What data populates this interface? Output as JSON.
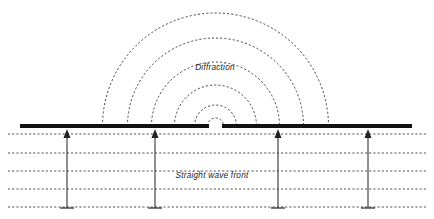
{
  "figure": {
    "title_visible": false,
    "background_color": "#ffffff",
    "width": 434,
    "height": 219
  },
  "labels": {
    "diffraction": "Diffraction",
    "straight_wave_front": "Straight wave front"
  },
  "label_positions": {
    "diffraction": {
      "x": 215,
      "y": 70
    },
    "straight_wave_front": {
      "x": 212,
      "y": 178
    }
  },
  "colors": {
    "barrier": "#111111",
    "wave_dash": "#303030",
    "arrow": "#333333",
    "text": "#1a1a1a",
    "background": "#ffffff"
  },
  "barrier": {
    "y": 126,
    "thickness": 4.2,
    "left_segment": {
      "x1": 20,
      "x2": 209
    },
    "right_segment": {
      "x1": 222,
      "x2": 412
    },
    "gap": {
      "x1": 209,
      "x2": 222,
      "center_x": 215.5,
      "width": 13
    }
  },
  "diffraction_arcs": {
    "center": {
      "x": 215.5,
      "y": 126
    },
    "count": 6,
    "radii": [
      8,
      21,
      41,
      64,
      88,
      113
    ]
  },
  "straight_wavefronts": {
    "count": 5,
    "x_start": 8,
    "x_end": 426,
    "y_values": [
      134,
      153,
      171,
      189,
      207
    ]
  },
  "incident_arrows": {
    "count": 4,
    "x_positions": [
      67,
      155,
      278,
      368
    ],
    "tail_y": 208,
    "head_y": 129,
    "foot_half_width": 7,
    "head_width": 7,
    "head_height": 9,
    "direction": "up"
  }
}
